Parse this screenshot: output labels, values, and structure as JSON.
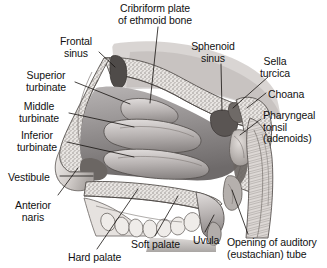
{
  "figure": {
    "style": "grayscale medical illustration",
    "background_color": "#ffffff",
    "ink_color": "#111111",
    "width": 327,
    "height": 268
  },
  "labels": [
    {
      "id": "cribriform-plate",
      "line1": "Cribriform plate",
      "line2": "of ethmoid bone",
      "align": "center",
      "x": 155,
      "y": 3
    },
    {
      "id": "frontal-sinus",
      "line1": "Frontal",
      "line2": "sinus",
      "align": "center",
      "x": 76,
      "y": 36
    },
    {
      "id": "sphenoid-sinus",
      "line1": "Sphenoid",
      "line2": "sinus",
      "align": "center",
      "x": 213,
      "y": 41
    },
    {
      "id": "sella-turcica",
      "line1": "Sella",
      "line2": "turcica",
      "align": "center",
      "x": 275,
      "y": 56
    },
    {
      "id": "superior-turbinate",
      "line1": "Superior",
      "line2": "turbinate",
      "align": "center",
      "x": 46,
      "y": 70
    },
    {
      "id": "choana",
      "line1": "Choana",
      "line2": "",
      "align": "left",
      "x": 268,
      "y": 89
    },
    {
      "id": "middle-turbinate",
      "line1": "Middle",
      "line2": "turbinate",
      "align": "center",
      "x": 39,
      "y": 101
    },
    {
      "id": "pharyngeal-tonsil",
      "line1": "Pharyngeal",
      "line2": "tonsil",
      "line3": "(adenoids)",
      "align": "left",
      "x": 263,
      "y": 110
    },
    {
      "id": "inferior-turbinate",
      "line1": "Inferior",
      "line2": "turbinate",
      "align": "center",
      "x": 37,
      "y": 130
    },
    {
      "id": "vestibule",
      "line1": "Vestibule",
      "line2": "",
      "align": "left",
      "x": 8,
      "y": 172
    },
    {
      "id": "anterior-naris",
      "line1": "Anterior",
      "line2": "naris",
      "align": "center",
      "x": 33,
      "y": 200
    },
    {
      "id": "soft-palate",
      "line1": "Soft palate",
      "line2": "",
      "align": "left",
      "x": 131,
      "y": 239
    },
    {
      "id": "uvula",
      "line1": "Uvula",
      "line2": "",
      "align": "left",
      "x": 193,
      "y": 235
    },
    {
      "id": "hard-palate",
      "line1": "Hard palate",
      "line2": "",
      "align": "left",
      "x": 68,
      "y": 252
    },
    {
      "id": "auditory-tube",
      "line1": "Opening of auditory",
      "line2": "(eustachian) tube",
      "align": "left",
      "x": 227,
      "y": 237
    }
  ],
  "leaders": [
    {
      "id": "leader-cribriform-plate",
      "x1": 158,
      "y1": 27,
      "x2": 150,
      "y2": 103
    },
    {
      "id": "leader-frontal-sinus",
      "x1": 99,
      "y1": 52,
      "x2": 115,
      "y2": 67
    },
    {
      "id": "leader-sphenoid-sinus",
      "x1": 221,
      "y1": 64,
      "x2": 222,
      "y2": 110
    },
    {
      "id": "leader-sella-turcica",
      "x1": 268,
      "y1": 77,
      "x2": 233,
      "y2": 108
    },
    {
      "id": "leader-superior-turbinate",
      "x1": 75,
      "y1": 82,
      "x2": 130,
      "y2": 104
    },
    {
      "id": "leader-choana",
      "x1": 266,
      "y1": 93,
      "x2": 247,
      "y2": 108
    },
    {
      "id": "leader-middle-turbinate",
      "x1": 69,
      "y1": 113,
      "x2": 134,
      "y2": 127
    },
    {
      "id": "leader-pharyngeal-tonsil",
      "x1": 261,
      "y1": 119,
      "x2": 240,
      "y2": 135
    },
    {
      "id": "leader-inferior-turbinate",
      "x1": 67,
      "y1": 142,
      "x2": 134,
      "y2": 157
    },
    {
      "id": "leader-vestibule",
      "x1": 60,
      "y1": 176,
      "x2": 93,
      "y2": 176
    },
    {
      "id": "leader-anterior-naris",
      "x1": 58,
      "y1": 195,
      "x2": 78,
      "y2": 168
    },
    {
      "id": "leader-soft-palate",
      "x1": 155,
      "y1": 236,
      "x2": 178,
      "y2": 196
    },
    {
      "id": "leader-uvula",
      "x1": 205,
      "y1": 232,
      "x2": 214,
      "y2": 215
    },
    {
      "id": "leader-hard-palate",
      "x1": 97,
      "y1": 249,
      "x2": 138,
      "y2": 189
    },
    {
      "id": "leader-auditory-tube",
      "x1": 248,
      "y1": 234,
      "x2": 232,
      "y2": 190
    }
  ]
}
